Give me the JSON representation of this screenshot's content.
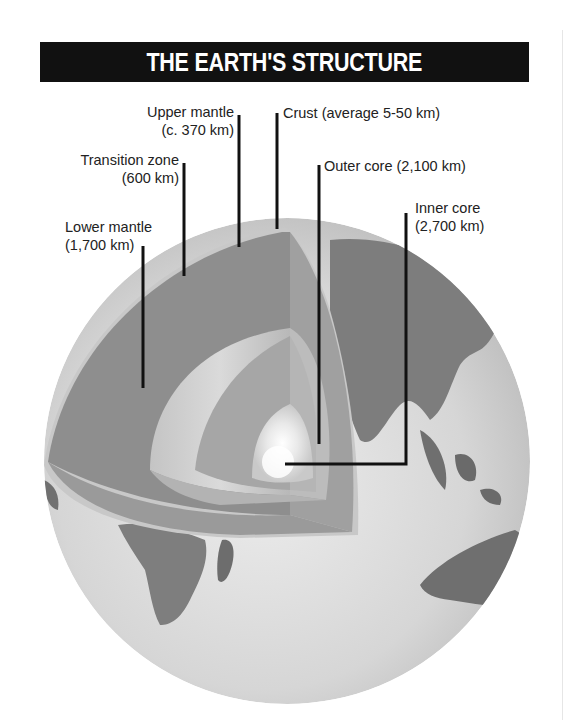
{
  "title": "THE EARTH'S STRUCTURE",
  "labels": {
    "upper_mantle": {
      "name": "Upper mantle",
      "depth": "(c. 370 km)"
    },
    "crust": {
      "name": "Crust (average 5-50 km)"
    },
    "transition_zone": {
      "name": "Transition zone",
      "depth": "(600 km)"
    },
    "outer_core": {
      "name": "Outer core (2,100 km)"
    },
    "inner_core": {
      "name": "Inner core",
      "depth": "(2,700 km)"
    },
    "lower_mantle": {
      "name": "Lower mantle",
      "depth": "(1,700 km)"
    }
  },
  "colors": {
    "title_bg": "#111111",
    "title_text": "#ffffff",
    "ocean": "#d9d9d9",
    "land": "#7a7a7a",
    "lower_mantle": "#8c8c8c",
    "outer_core": "#a8a8a8",
    "inner_core": "#f4f4f4",
    "leader_line": "#111111"
  }
}
